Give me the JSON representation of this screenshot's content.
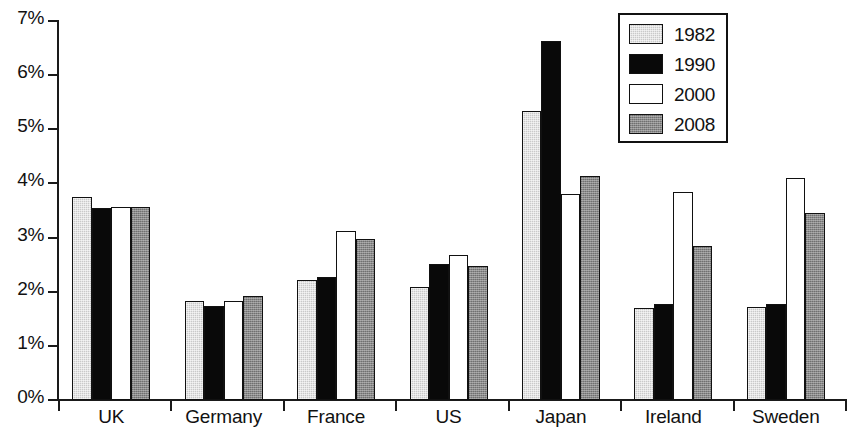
{
  "chart_data": {
    "type": "bar",
    "title": "",
    "subtitle": "",
    "xlabel": "",
    "ylabel": "",
    "categories": [
      "UK",
      "Germany",
      "France",
      "US",
      "Japan",
      "Ireland",
      "Sweden"
    ],
    "series": [
      {
        "name": "1982",
        "color": "#c9c9c9",
        "values": [
          3.75,
          1.82,
          2.22,
          2.08,
          5.33,
          1.7,
          1.72
        ]
      },
      {
        "name": "1990",
        "color": "#090909",
        "values": [
          3.55,
          1.73,
          2.28,
          2.52,
          6.63,
          1.78,
          1.77
        ]
      },
      {
        "name": "2000",
        "color": "#ffffff",
        "values": [
          3.56,
          1.82,
          3.13,
          2.68,
          3.8,
          3.85,
          4.1
        ]
      },
      {
        "name": "2008",
        "color": "#898989",
        "values": [
          3.56,
          1.92,
          2.98,
          2.48,
          4.13,
          2.85,
          3.45
        ]
      }
    ],
    "ylim": [
      0,
      7
    ],
    "ytick_values": [
      0,
      1,
      2,
      3,
      4,
      5,
      6,
      7
    ],
    "ytick_labels": [
      "0%",
      "1%",
      "2%",
      "3%",
      "4%",
      "5%",
      "6%",
      "7%"
    ],
    "grid": false,
    "legend_position": "top-right",
    "legend_entries": [
      "1982",
      "1990",
      "2000",
      "2008"
    ],
    "annotations": []
  }
}
